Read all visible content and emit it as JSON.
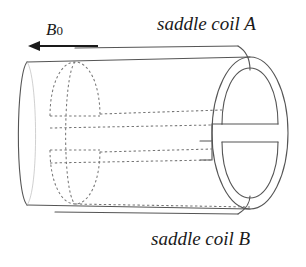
{
  "figure": {
    "type": "technical-line-diagram",
    "background_color": "#ffffff",
    "line_color": "#555555",
    "dotted_line_color": "#777777",
    "text_color": "#1a1a1a"
  },
  "labels": {
    "coil_a": "saddle coil A",
    "coil_b": "saddle coil B",
    "b0_symbol": "B",
    "b0_subscript": "0"
  },
  "annotations": {
    "b0_arrow": {
      "name": "b0-field-arrow",
      "direction": "left",
      "x_start": 98,
      "x_end": 30,
      "y": 46
    }
  },
  "geometry": {
    "cylinder": {
      "left_x": 27,
      "right_x": 250,
      "top_y": 57,
      "bottom_y": 209,
      "left_ellipse_rx": 22,
      "left_ellipse_ry": 76,
      "right_ellipse_rx": 38,
      "right_ellipse_ry": 76
    },
    "coil_a": {
      "top_wire_y": 48,
      "inner_wire_y": 103,
      "step_wire_y": 118,
      "visible": "top half, front wire solid at right, hidden wires dotted"
    },
    "coil_b": {
      "bottom_wire_y": 200,
      "inner_wire_y": 143,
      "step_wire_y": 158,
      "visible": "bottom half, front wire solid at right, hidden wires dotted"
    }
  }
}
